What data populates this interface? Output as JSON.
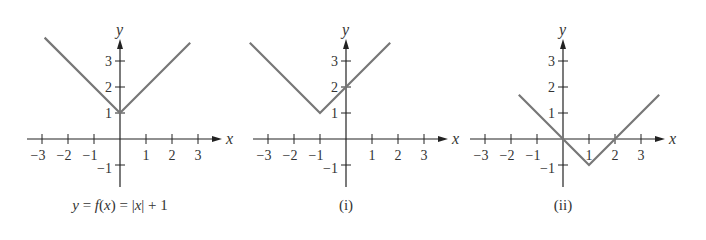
{
  "chart_data": [
    {
      "type": "line",
      "title": "y = f(x) = |x| + 1",
      "xlabel": "x",
      "ylabel": "y",
      "xticks": [
        -3,
        -2,
        -1,
        1,
        2,
        3
      ],
      "yticks": [
        -1,
        1,
        2,
        3
      ],
      "xlim": [
        -3.5,
        3.5
      ],
      "ylim": [
        -1.5,
        4
      ],
      "points": [
        [
          -2.9,
          3.9
        ],
        [
          0,
          1
        ],
        [
          2.7,
          3.7
        ]
      ]
    },
    {
      "type": "line",
      "title": "(i)",
      "xlabel": "x",
      "ylabel": "y",
      "xticks": [
        -3,
        -2,
        -1,
        1,
        2,
        3
      ],
      "yticks": [
        -1,
        1,
        2,
        3
      ],
      "xlim": [
        -3.5,
        3.5
      ],
      "ylim": [
        -1.5,
        4
      ],
      "points": [
        [
          -3.7,
          3.7
        ],
        [
          -1,
          1
        ],
        [
          1.7,
          3.7
        ]
      ]
    },
    {
      "type": "line",
      "title": "(ii)",
      "xlabel": "x",
      "ylabel": "y",
      "xticks": [
        -3,
        -2,
        -1,
        1,
        2,
        3
      ],
      "yticks": [
        -1,
        1,
        2,
        3
      ],
      "xlim": [
        -3.5,
        3.5
      ],
      "ylim": [
        -1.5,
        4
      ],
      "points": [
        [
          -1.7,
          1.7
        ],
        [
          1,
          -1
        ],
        [
          3.7,
          1.7
        ]
      ]
    }
  ],
  "captions": {
    "g0_prefix": "y = f(x) = ",
    "g0_suffix": "x",
    "g0_end": " + 1",
    "g1": "(i)",
    "g2": "(ii)"
  }
}
